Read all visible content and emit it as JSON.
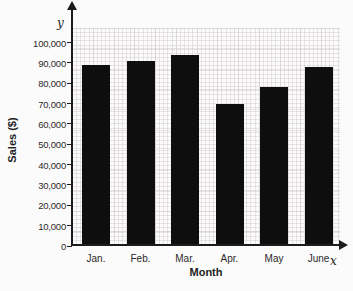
{
  "figure": {
    "y_axis_arrow_label": "y",
    "x_axis_arrow_label": "x"
  },
  "chart_data": {
    "type": "bar",
    "categories": [
      "Jan.",
      "Feb.",
      "Mar.",
      "Apr.",
      "May",
      "June"
    ],
    "values": [
      89000,
      91000,
      94000,
      70000,
      78000,
      88000
    ],
    "title": "",
    "xlabel": "Month",
    "ylabel": "Sales ($)",
    "ylim": [
      0,
      100000
    ],
    "ytick_step": 10000,
    "ytick_labels": [
      "0",
      "10,000",
      "20,000",
      "30,000",
      "40,000",
      "50,000",
      "60,000",
      "70,000",
      "80,000",
      "90,000",
      "100,000"
    ],
    "grid": "fine graph-paper grid, light gray",
    "legend": "none",
    "bar_color": "#0e0e0e",
    "axis_color": "#1c1c1c"
  }
}
